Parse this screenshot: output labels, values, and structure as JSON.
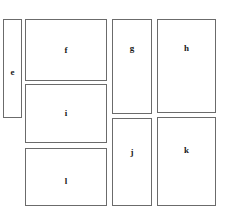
{
  "diagram": {
    "type": "labeled-rectangle-layout",
    "background_color": "#ffffff",
    "stroke_color": "#6b6b6b",
    "panels": [
      {
        "id": "e",
        "label": "e"
      },
      {
        "id": "f",
        "label": "f"
      },
      {
        "id": "g",
        "label": "g"
      },
      {
        "id": "h",
        "label": "h"
      },
      {
        "id": "i",
        "label": "i"
      },
      {
        "id": "j",
        "label": "j"
      },
      {
        "id": "k",
        "label": "k"
      },
      {
        "id": "l",
        "label": "l"
      }
    ]
  }
}
